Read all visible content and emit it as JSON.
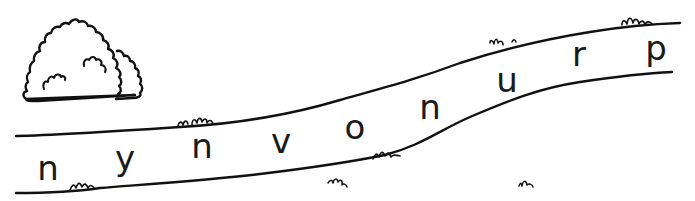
{
  "worksheet": {
    "letters": [
      "n",
      "y",
      "n",
      "v",
      "o",
      "n",
      "u",
      "r",
      "p"
    ],
    "colors": {
      "ink": "#111111",
      "background": "#ffffff"
    },
    "illustrations": [
      "bush",
      "winding-path",
      "grass-tufts"
    ]
  }
}
